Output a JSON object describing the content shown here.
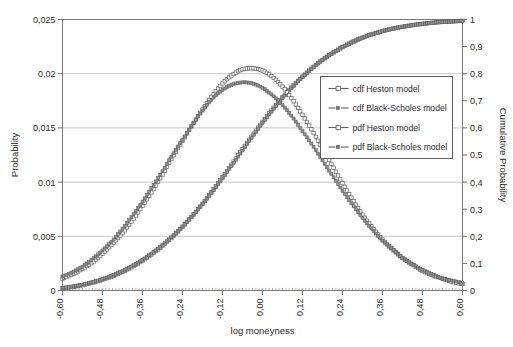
{
  "chart_data": {
    "type": "line",
    "title": "",
    "xlabel": "log moneyness",
    "ylabel": "Probability",
    "ylabel_right": "Cumulative Probability",
    "xlim": [
      -0.6,
      0.6
    ],
    "ylim": [
      0,
      0.025
    ],
    "ylim_right": [
      0,
      1
    ],
    "grid": true,
    "legend_position": "center-right",
    "xticks": [
      "-0,60",
      "-0,48",
      "-0,36",
      "-0,24",
      "-0,12",
      "0,00",
      "0,12",
      "0,24",
      "0,36",
      "0,48",
      "0,60"
    ],
    "xtick_values": [
      -0.6,
      -0.48,
      -0.36,
      -0.24,
      -0.12,
      0.0,
      0.12,
      0.24,
      0.36,
      0.48,
      0.6
    ],
    "yticks": [
      "0",
      "0,005",
      "0,01",
      "0,015",
      "0,02",
      "0,025"
    ],
    "ytick_values": [
      0,
      0.005,
      0.01,
      0.015,
      0.02,
      0.025
    ],
    "yticks_right": [
      "0",
      "0,1",
      "0,2",
      "0,3",
      "0,4",
      "0,5",
      "0,6",
      "0,7",
      "0,8",
      "0,9",
      "1"
    ],
    "ytick_right_values": [
      0,
      0.1,
      0.2,
      0.3,
      0.4,
      0.5,
      0.6,
      0.7,
      0.8,
      0.9,
      1.0
    ],
    "legend": [
      {
        "label": "cdf Heston model",
        "marker": "open-square",
        "line": "solid",
        "axis": "right"
      },
      {
        "label": "cdf Black-Scholes model",
        "marker": "filled-triangle",
        "line": "dashed",
        "axis": "right"
      },
      {
        "label": "pdf Heston model",
        "marker": "open-square",
        "line": "solid",
        "axis": "left"
      },
      {
        "label": "pdf Black-Scholes model",
        "marker": "filled-triangle",
        "line": "dashed",
        "axis": "left"
      }
    ],
    "x": [
      -0.6,
      -0.57,
      -0.54,
      -0.51,
      -0.48,
      -0.45,
      -0.42,
      -0.39,
      -0.36,
      -0.33,
      -0.3,
      -0.27,
      -0.24,
      -0.21,
      -0.18,
      -0.15,
      -0.12,
      -0.09,
      -0.06,
      -0.03,
      0.0,
      0.03,
      0.06,
      0.09,
      0.12,
      0.15,
      0.18,
      0.21,
      0.24,
      0.27,
      0.3,
      0.33,
      0.36,
      0.39,
      0.42,
      0.45,
      0.48,
      0.51,
      0.54,
      0.57,
      0.6
    ],
    "series": [
      {
        "name": "cdf Heston model",
        "axis": "right",
        "unit": "cumulative probability",
        "values": [
          0.008,
          0.013,
          0.02,
          0.029,
          0.04,
          0.053,
          0.069,
          0.088,
          0.11,
          0.136,
          0.165,
          0.198,
          0.235,
          0.276,
          0.32,
          0.368,
          0.418,
          0.47,
          0.522,
          0.573,
          0.622,
          0.669,
          0.713,
          0.753,
          0.789,
          0.822,
          0.851,
          0.876,
          0.898,
          0.917,
          0.933,
          0.946,
          0.957,
          0.966,
          0.973,
          0.979,
          0.984,
          0.988,
          0.991,
          0.993,
          0.995
        ]
      },
      {
        "name": "cdf Black-Scholes model",
        "axis": "right",
        "unit": "cumulative probability",
        "values": [
          0.01,
          0.015,
          0.022,
          0.031,
          0.042,
          0.056,
          0.072,
          0.091,
          0.113,
          0.139,
          0.168,
          0.2,
          0.236,
          0.276,
          0.319,
          0.365,
          0.414,
          0.465,
          0.517,
          0.568,
          0.618,
          0.665,
          0.71,
          0.751,
          0.788,
          0.821,
          0.851,
          0.876,
          0.898,
          0.917,
          0.933,
          0.946,
          0.957,
          0.966,
          0.973,
          0.979,
          0.984,
          0.988,
          0.991,
          0.993,
          0.995
        ]
      },
      {
        "name": "pdf Heston model",
        "axis": "left",
        "unit": "probability",
        "values": [
          0.0011,
          0.0015,
          0.002,
          0.0026,
          0.0034,
          0.0043,
          0.0053,
          0.0065,
          0.0078,
          0.0092,
          0.0107,
          0.0123,
          0.0138,
          0.0153,
          0.0167,
          0.018,
          0.0191,
          0.0199,
          0.0204,
          0.0205,
          0.0203,
          0.0197,
          0.0188,
          0.0176,
          0.0162,
          0.0147,
          0.0131,
          0.0115,
          0.0099,
          0.0084,
          0.007,
          0.0058,
          0.0047,
          0.0038,
          0.003,
          0.0024,
          0.0018,
          0.0014,
          0.0011,
          0.0008,
          0.0006
        ]
      },
      {
        "name": "pdf Black-Scholes model",
        "axis": "left",
        "unit": "probability",
        "values": [
          0.0013,
          0.0017,
          0.0022,
          0.0029,
          0.0037,
          0.0046,
          0.0057,
          0.0069,
          0.0082,
          0.0096,
          0.011,
          0.0125,
          0.0139,
          0.0153,
          0.0166,
          0.0177,
          0.0185,
          0.019,
          0.0192,
          0.0191,
          0.0187,
          0.018,
          0.0171,
          0.016,
          0.0147,
          0.0134,
          0.012,
          0.0106,
          0.0092,
          0.0079,
          0.0067,
          0.0056,
          0.0046,
          0.0038,
          0.003,
          0.0024,
          0.0019,
          0.0015,
          0.0011,
          0.0009,
          0.0007
        ]
      }
    ]
  }
}
